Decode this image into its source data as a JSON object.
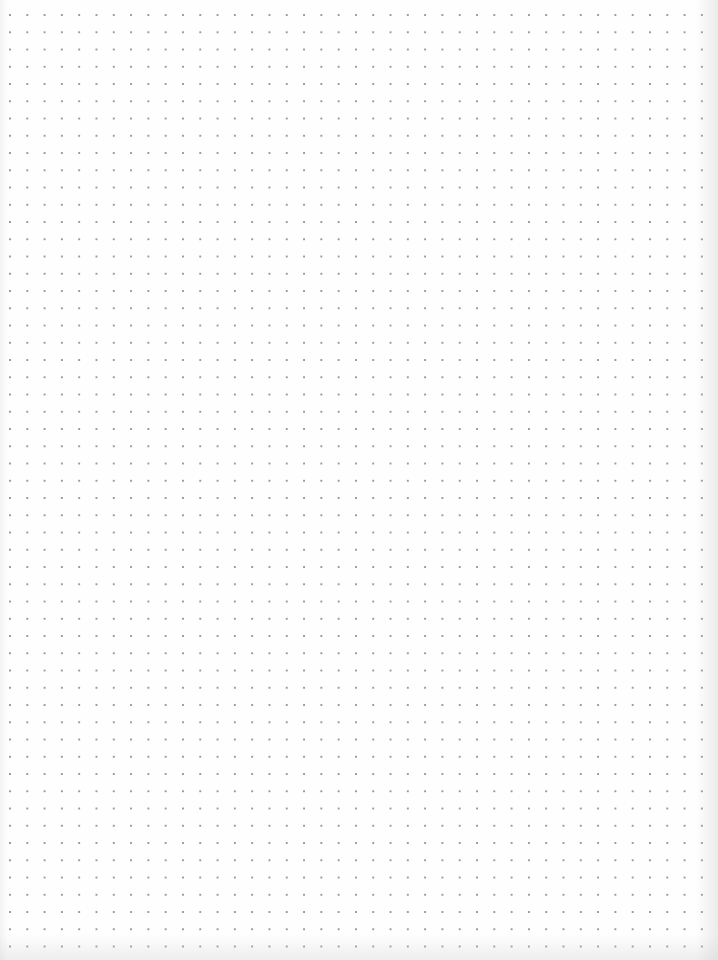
{
  "page": {
    "type": "dot-grid-paper",
    "background_color": "#fefefe",
    "dot_color": "#9a9a9a",
    "grid_spacing_px": 17.3,
    "columns": 40,
    "rows": 54
  }
}
